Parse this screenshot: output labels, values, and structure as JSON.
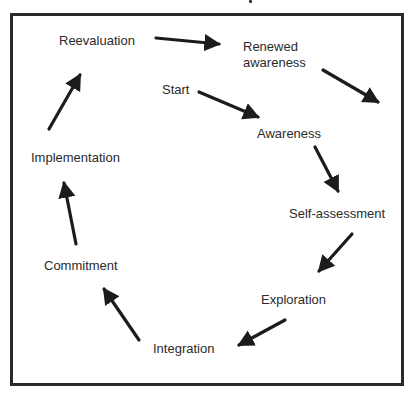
{
  "diagram": {
    "type": "cycle",
    "colors": {
      "frame": "#2a2a2a",
      "text": "#2b2b2b",
      "arrow": "#1c1c1c",
      "background": "#ffffff"
    },
    "nodes": [
      {
        "id": "start",
        "label": "Start"
      },
      {
        "id": "awareness",
        "label": "Awareness"
      },
      {
        "id": "self_assessment",
        "label": "Self-assessment"
      },
      {
        "id": "exploration",
        "label": "Exploration"
      },
      {
        "id": "integration",
        "label": "Integration"
      },
      {
        "id": "commitment",
        "label": "Commitment"
      },
      {
        "id": "implementation",
        "label": "Implementation"
      },
      {
        "id": "reevaluation",
        "label": "Reevaluation"
      },
      {
        "id": "renewed_awareness",
        "label_lines": [
          "Renewed",
          "awareness"
        ]
      }
    ],
    "edges": [
      {
        "from": "start",
        "to": "awareness"
      },
      {
        "from": "awareness",
        "to": "self_assessment"
      },
      {
        "from": "self_assessment",
        "to": "exploration"
      },
      {
        "from": "exploration",
        "to": "integration"
      },
      {
        "from": "integration",
        "to": "commitment"
      },
      {
        "from": "commitment",
        "to": "implementation"
      },
      {
        "from": "implementation",
        "to": "reevaluation"
      },
      {
        "from": "reevaluation",
        "to": "renewed_awareness"
      },
      {
        "from": "renewed_awareness",
        "to": "next_cycle"
      }
    ]
  }
}
